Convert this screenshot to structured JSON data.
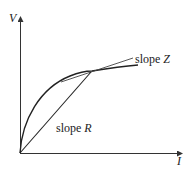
{
  "diagram": {
    "type": "voltage-current curve",
    "axes": {
      "y_label": "V",
      "x_label": "I"
    },
    "annotations": {
      "tangent": {
        "prefix": "slope ",
        "symbol": "Z"
      },
      "secant": {
        "prefix": "slope ",
        "symbol": "R"
      }
    },
    "colors": {
      "line": "#222222",
      "background": "#ffffff"
    }
  }
}
